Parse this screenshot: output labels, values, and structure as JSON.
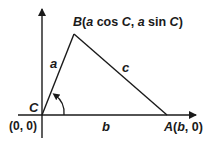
{
  "diagram": {
    "type": "triangle-coordinate-diagram",
    "points": {
      "C": {
        "label": "C",
        "coord_label": "(0, 0)"
      },
      "B": {
        "label_parts": [
          "B",
          "(",
          "a",
          " cos ",
          "C",
          ", ",
          "a",
          " sin ",
          "C",
          ")"
        ]
      },
      "A": {
        "label_parts": [
          "A",
          "(",
          "b",
          ", 0)"
        ]
      }
    },
    "sides": {
      "a": "a",
      "b": "b",
      "c": "c"
    },
    "angle_label": "C",
    "colors": {
      "line": "#1a1a1a",
      "background": "#ffffff"
    }
  }
}
